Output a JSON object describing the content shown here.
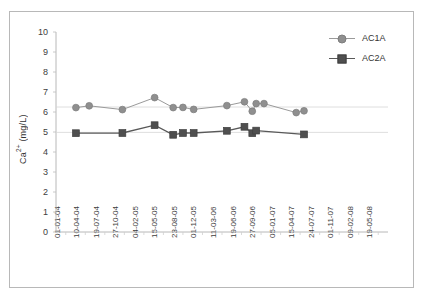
{
  "chart_data": {
    "type": "line",
    "title": "",
    "xlabel": "",
    "ylabel": "Ca2+ (mg/L)",
    "ylabel_base": "Ca",
    "ylabel_sup": "2+",
    "ylabel_unit": " (mg/L)",
    "ylim": [
      0,
      10
    ],
    "ytick_step": 1,
    "yticks": [
      "10",
      "9",
      "8",
      "7",
      "6",
      "5",
      "4",
      "3",
      "2",
      "1",
      "0"
    ],
    "categories": [
      "01-01-04",
      "10-04-04",
      "19-07-04",
      "27-10-04",
      "04-02-05",
      "15-05-05",
      "23-08-05",
      "01-12-05",
      "11-03-06",
      "19-06-06",
      "27-09-06",
      "05-01-07",
      "15-04-07",
      "24-07-07",
      "01-11-07",
      "09-02-08",
      "19-05-08"
    ],
    "grid": false,
    "legend_position": "top-right",
    "series": [
      {
        "name": "AC1A",
        "marker": "circle",
        "color": "#8f8f8f",
        "line_color": "#9a9a9a",
        "x": [
          0.52,
          1.2,
          2.9,
          4.55,
          5.5,
          6.0,
          6.55,
          8.25,
          9.15,
          9.55,
          9.75,
          10.15,
          11.8,
          12.2
        ],
        "values": [
          6.22,
          6.31,
          6.12,
          6.72,
          6.22,
          6.23,
          6.13,
          6.32,
          6.51,
          6.04,
          6.42,
          6.42,
          5.97,
          6.06
        ]
      },
      {
        "name": "AC2A",
        "marker": "square",
        "color": "#4f4f4f",
        "line_color": "#595959",
        "x": [
          0.52,
          2.9,
          4.55,
          5.5,
          6.0,
          6.55,
          8.25,
          9.15,
          9.55,
          9.75,
          12.2
        ],
        "values": [
          4.94,
          4.95,
          5.34,
          4.86,
          4.95,
          4.95,
          5.06,
          5.26,
          4.94,
          5.07,
          4.88
        ]
      }
    ]
  },
  "legend": {
    "items": [
      {
        "label": "AC1A"
      },
      {
        "label": "AC2A"
      }
    ]
  }
}
